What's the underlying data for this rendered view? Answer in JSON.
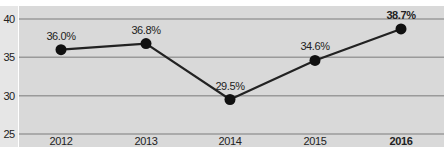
{
  "chart_data": {
    "type": "line",
    "title": "",
    "xlabel": "",
    "ylabel": "",
    "categories": [
      "2012",
      "2013",
      "2014",
      "2015",
      "2016"
    ],
    "values": [
      36.0,
      36.8,
      29.5,
      34.6,
      38.7
    ],
    "data_labels": [
      "36.0%",
      "36.8%",
      "29.5%",
      "34.6%",
      "38.7%"
    ],
    "highlighted_category": "2016",
    "yticks": [
      25,
      30,
      35,
      40
    ],
    "ytick_labels": [
      "25",
      "30",
      "35",
      "40"
    ],
    "ylim": [
      24,
      41.5
    ],
    "grid": true,
    "legend": "none",
    "colors": {
      "line": "#222222",
      "marker": "#111111",
      "plot_background": "#d9d9d9",
      "gridline": "#9a9a9a",
      "text": "#222222"
    }
  }
}
